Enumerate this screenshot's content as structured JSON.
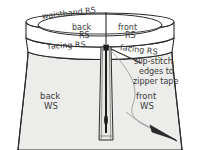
{
  "figure": {
    "type": "sewing-instruction-illustration",
    "colors": {
      "background": "#ffffff",
      "garment_fill": "#ececea",
      "waistband_fill": "#ffffff",
      "facing_fill": "#ffffff",
      "zipper_tape_fill": "#e9e7e4",
      "zipper_teeth": "#1c1c1c",
      "outline": "#2b2b2b",
      "text": "#3b3b3b",
      "thread": "#8d8d8d",
      "needle": "#2b2b2b"
    }
  },
  "labels": {
    "waistband_rs": "waistband RS",
    "back_rs_line1": "back",
    "back_rs_line2": "RS",
    "front_rs_line1": "front",
    "front_rs_line2": "RS",
    "facing_rs_left": "facing RS",
    "facing_rs_right": "facing RS",
    "back_ws_line1": "back",
    "back_ws_line2": "WS",
    "front_ws_line1": "front",
    "front_ws_line2": "WS"
  },
  "callout": {
    "line1": "slip-stitch",
    "line2": "edges to",
    "line3": "zipper tape",
    "target": "zipper-tape-top"
  },
  "parts": {
    "waistband": "waistband",
    "facing": "facing",
    "garment_back": "back-panel",
    "garment_front": "front-panel",
    "zipper": "zipper",
    "zipper_teeth": "zipper-teeth",
    "needle": "needle",
    "thread": "thread",
    "center_back_seam": "center-back-seam"
  }
}
